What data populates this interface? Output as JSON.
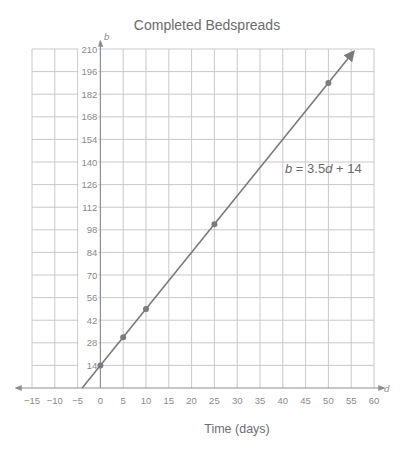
{
  "chart_data": {
    "type": "line",
    "title": "Completed Bedspreads",
    "xlabel": "Time (days)",
    "ylabel": "",
    "x_variable": "d",
    "y_variable": "b",
    "equation": "b = 3.5d + 14",
    "equation_parts": {
      "lhs": "b",
      "eq": " = 3.5",
      "var": "d",
      "rhs": " + 14"
    },
    "xlim": [
      -15,
      60
    ],
    "ylim": [
      0,
      210
    ],
    "x_ticks": [
      -15,
      -10,
      -5,
      0,
      5,
      10,
      15,
      20,
      25,
      30,
      35,
      40,
      45,
      50,
      55,
      60
    ],
    "x_tick_labels": [
      "−15",
      "−10",
      "−5",
      "0",
      "5",
      "10",
      "15",
      "20",
      "25",
      "30",
      "35",
      "40",
      "45",
      "50",
      "55",
      "60"
    ],
    "y_ticks": [
      14,
      28,
      42,
      56,
      70,
      84,
      98,
      112,
      126,
      140,
      154,
      168,
      182,
      196,
      210
    ],
    "grid": true,
    "legend": null,
    "line": {
      "slope": 3.5,
      "intercept": 14,
      "x_start": -4,
      "x_end": 55.5,
      "arrow_end": true
    },
    "series": [
      {
        "name": "b = 3.5d + 14",
        "x": [
          0,
          5,
          10,
          25,
          50
        ],
        "values": [
          14,
          31.5,
          49,
          101.5,
          189
        ]
      }
    ],
    "colors": {
      "line": "#7a7a7a",
      "grid": "#c9c9c9",
      "text": "#6b6b6b"
    }
  }
}
